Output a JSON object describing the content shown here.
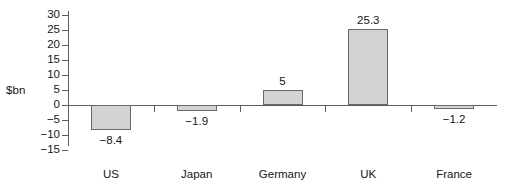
{
  "chart_data": {
    "type": "bar",
    "title": "",
    "xlabel": "",
    "ylabel": "$bn",
    "categories": [
      "US",
      "Japan",
      "Germany",
      "UK",
      "France"
    ],
    "values": [
      -8.4,
      -1.9,
      5,
      25.3,
      -1.2
    ],
    "value_labels": [
      "−8.4",
      "−1.9",
      "5",
      "25.3",
      "−1.2"
    ],
    "ylim": [
      -15,
      30
    ],
    "yticks": [
      30,
      25,
      20,
      15,
      10,
      5,
      0,
      -5,
      -10,
      -15
    ],
    "ytick_labels": [
      "30",
      "25",
      "20",
      "15",
      "10",
      "5",
      "0",
      "−5",
      "−10",
      "−15"
    ],
    "grid": false,
    "legend": null,
    "bar_fill_color": "#d3d3d3",
    "bar_edge_color": "#6a6a6a",
    "axis_color": "#5d5d5d",
    "text_color": "#151515"
  }
}
